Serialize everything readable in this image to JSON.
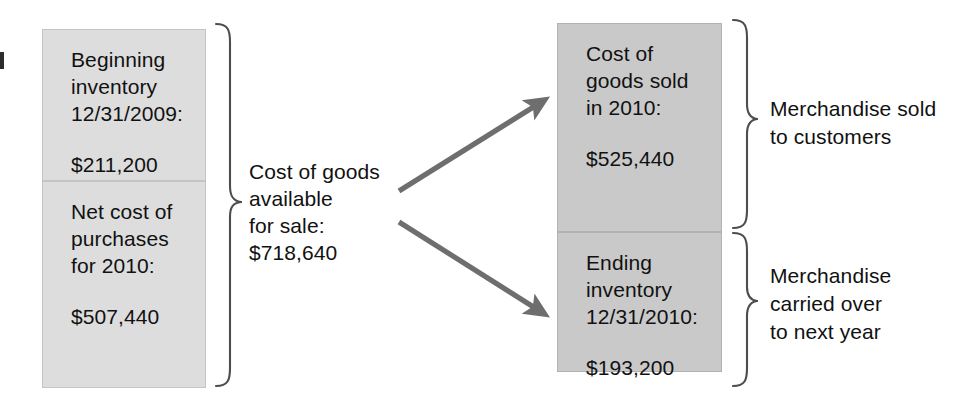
{
  "diagram": {
    "colors": {
      "left_box_fill": "#dddddd",
      "right_box_fill": "#c9c9c9",
      "box_border": "#c4c4c4",
      "arrow": "#6e6e6e",
      "bracket": "#4d4d4d",
      "text": "#111111",
      "background": "#ffffff"
    }
  },
  "left_column": {
    "beginning_inventory": {
      "line1": "Beginning",
      "line2": "inventory",
      "line3": "12/31/2009:",
      "amount": "$211,200"
    },
    "net_cost_of_purchases": {
      "line1": "Net cost of",
      "line2": "purchases",
      "line3": "for 2010:",
      "amount": "$507,440"
    }
  },
  "center": {
    "line1": "Cost of goods",
    "line2": "available",
    "line3": "for sale:",
    "amount": "$718,640"
  },
  "right_column": {
    "cost_of_goods_sold": {
      "line1": "Cost of",
      "line2": "goods sold",
      "line3": "in 2010:",
      "amount": "$525,440"
    },
    "ending_inventory": {
      "line1": "Ending",
      "line2": "inventory",
      "line3": "12/31/2010:",
      "amount": "$193,200"
    }
  },
  "annotations": {
    "sold": {
      "line1": "Merchandise sold",
      "line2": "to customers"
    },
    "carried_over": {
      "line1": "Merchandise",
      "line2": "carried over",
      "line3": "to next year"
    }
  },
  "icons": {
    "arrow_up": "arrow-up-right-icon",
    "arrow_down": "arrow-down-right-icon",
    "left_brace": "left-curly-brace-icon",
    "right_brace_top": "right-curly-brace-icon",
    "right_brace_bottom": "right-curly-brace-icon"
  }
}
